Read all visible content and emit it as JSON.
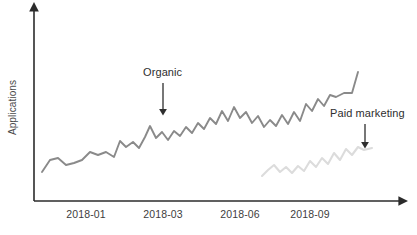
{
  "chart_data": {
    "type": "line",
    "title": "",
    "subtitle": "",
    "xlabel": "",
    "ylabel": "Applications",
    "grid": false,
    "legend_position": "inline-annotations",
    "x_tick_labels": [
      "2018-01",
      "2018-03",
      "2018-06",
      "2018-09"
    ],
    "x_tick_positions_px": [
      86,
      163,
      240,
      310
    ],
    "y_tick_labels": [],
    "xlim_px": [
      34,
      400
    ],
    "ylim_px": [
      201,
      10
    ],
    "axes": {
      "x_axis_arrow": true,
      "y_axis_arrow": true,
      "origin_px": [
        34,
        201
      ],
      "color": "#2b2b2b"
    },
    "series": [
      {
        "name": "Organic",
        "color": "#8a8a8a",
        "stroke_width": 1.9,
        "points_px": [
          [
            42,
            172
          ],
          [
            50,
            160
          ],
          [
            58,
            158
          ],
          [
            66,
            165
          ],
          [
            74,
            163
          ],
          [
            82,
            160
          ],
          [
            90,
            152
          ],
          [
            98,
            155
          ],
          [
            106,
            152
          ],
          [
            114,
            157
          ],
          [
            120,
            141
          ],
          [
            126,
            147
          ],
          [
            133,
            142
          ],
          [
            139,
            148
          ],
          [
            145,
            137
          ],
          [
            150,
            126
          ],
          [
            156,
            138
          ],
          [
            162,
            132
          ],
          [
            168,
            140
          ],
          [
            174,
            131
          ],
          [
            180,
            136
          ],
          [
            186,
            127
          ],
          [
            192,
            133
          ],
          [
            198,
            123
          ],
          [
            204,
            129
          ],
          [
            210,
            118
          ],
          [
            216,
            124
          ],
          [
            222,
            111
          ],
          [
            228,
            121
          ],
          [
            234,
            107
          ],
          [
            240,
            118
          ],
          [
            246,
            112
          ],
          [
            252,
            123
          ],
          [
            258,
            116
          ],
          [
            264,
            127
          ],
          [
            270,
            120
          ],
          [
            276,
            126
          ],
          [
            282,
            115
          ],
          [
            288,
            124
          ],
          [
            294,
            112
          ],
          [
            300,
            121
          ],
          [
            306,
            104
          ],
          [
            312,
            111
          ],
          [
            318,
            99
          ],
          [
            324,
            106
          ],
          [
            330,
            95
          ],
          [
            336,
            97
          ],
          [
            344,
            93
          ],
          [
            352,
            93
          ],
          [
            358,
            72
          ]
        ],
        "start_x_label": "2018-01",
        "trend": "increasing"
      },
      {
        "name": "Paid marketing",
        "color": "#dcdcdc",
        "stroke_width": 2.1,
        "points_px": [
          [
            262,
            176
          ],
          [
            268,
            170
          ],
          [
            274,
            165
          ],
          [
            280,
            172
          ],
          [
            286,
            167
          ],
          [
            292,
            173
          ],
          [
            298,
            166
          ],
          [
            304,
            171
          ],
          [
            310,
            161
          ],
          [
            316,
            167
          ],
          [
            322,
            158
          ],
          [
            328,
            164
          ],
          [
            334,
            153
          ],
          [
            340,
            160
          ],
          [
            346,
            149
          ],
          [
            352,
            155
          ],
          [
            358,
            147
          ],
          [
            364,
            150
          ],
          [
            372,
            148
          ]
        ],
        "start_x_label": "2018-07",
        "trend": "increasing"
      }
    ],
    "annotations": [
      {
        "id": "organic-annotation",
        "label": "Organic",
        "text_x_px": 143,
        "text_y_px": 76,
        "arrow_x_px": 163,
        "arrow_y_start_px": 83,
        "arrow_y_end_px": 111,
        "arrow_direction": "down",
        "color": "#2e2e2e"
      },
      {
        "id": "paid-marketing-annotation",
        "label": "Paid marketing",
        "text_x_px": 330,
        "text_y_px": 117,
        "arrow_x_px": 365,
        "arrow_y_start_px": 124,
        "arrow_y_end_px": 144,
        "arrow_direction": "down",
        "color": "#2e2e2e"
      }
    ]
  },
  "colors": {
    "background": "#ffffff",
    "axis": "#2b2b2b",
    "organic_line": "#8a8a8a",
    "paid_line": "#dcdcdc",
    "text": "#2e2e2e",
    "tick_text": "#3d3d3d"
  }
}
